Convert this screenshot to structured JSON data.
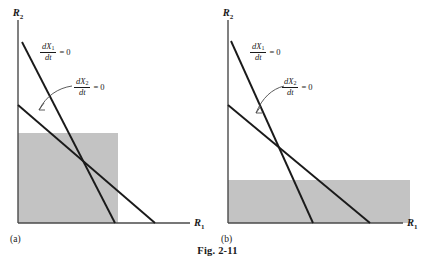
{
  "figure": {
    "caption": "Fig. 2-11",
    "axis_labels": {
      "vertical": "R",
      "vertical_sub": "2",
      "horizontal": "R",
      "horizontal_sub": "1"
    },
    "isocline_labels": {
      "first": {
        "numerator": "dX",
        "numerator_sub": "1",
        "denominator": "dt",
        "equals": "= 0"
      },
      "second": {
        "numerator": "dX",
        "numerator_sub": "2",
        "denominator": "dt",
        "equals": "= 0"
      }
    },
    "colors": {
      "shade": "#c3c3c3",
      "isocline": "#1a1a1a",
      "axis": "#4a4a4a",
      "background": "#ffffff"
    },
    "panels": [
      {
        "id": "a",
        "caption": "(a)",
        "shaded_region": {
          "shape": "square",
          "x": 18,
          "y": 133,
          "width": 100,
          "height": 90
        },
        "isoclines": [
          {
            "name": "dX1/dt",
            "x1": 22,
            "y1": 42,
            "x2": 115,
            "y2": 223
          },
          {
            "name": "dX2/dt",
            "x1": 18,
            "y1": 105,
            "x2": 155,
            "y2": 223
          }
        ],
        "intersection": {
          "x": 76,
          "y": 154
        }
      },
      {
        "id": "b",
        "caption": "(b)",
        "shaded_region": {
          "shape": "band",
          "x": 10,
          "y": 180,
          "width": 182,
          "height": 43
        },
        "isoclines": [
          {
            "name": "dX1/dt",
            "x1": 13,
            "y1": 41,
            "x2": 95,
            "y2": 223
          },
          {
            "name": "dX2/dt",
            "x1": 10,
            "y1": 105,
            "x2": 152,
            "y2": 223
          }
        ],
        "intersection": {
          "x": 67,
          "y": 150
        }
      }
    ]
  }
}
